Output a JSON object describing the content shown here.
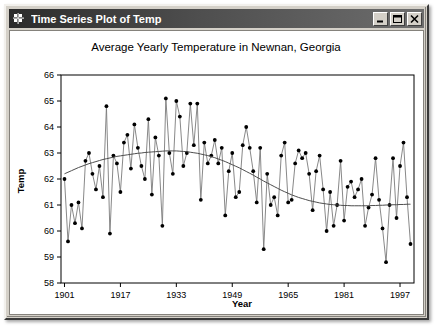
{
  "window": {
    "title": "Time Series Plot of Temp",
    "icon": "grid-chart-icon",
    "buttons": {
      "minimize": "minimize-icon",
      "maximize": "maximize-icon",
      "close": "close-icon"
    }
  },
  "colors": {
    "titlebar_dark": "#2b2b2b",
    "titlebar_light": "#6d6d6d",
    "window_face": "#d4d0c8",
    "plot_background": "#ffffff",
    "series_line": "#7a7a7a",
    "marker_fill": "#000000",
    "trend_line": "#4d4d4d",
    "axis": "#000000"
  },
  "chart_data": {
    "type": "line",
    "title": "Average Yearly Temperature in Newnan, Georgia",
    "xlabel": "Year",
    "ylabel": "Temp",
    "xlim": [
      1900,
      2001
    ],
    "ylim": [
      58,
      66
    ],
    "xticks": [
      1901,
      1917,
      1933,
      1949,
      1965,
      1981,
      1997
    ],
    "yticks": [
      58,
      59,
      60,
      61,
      62,
      63,
      64,
      65,
      66
    ],
    "grid": false,
    "legend": "none",
    "markers": true,
    "x": [
      1901,
      1902,
      1903,
      1904,
      1905,
      1906,
      1907,
      1908,
      1909,
      1910,
      1911,
      1912,
      1913,
      1914,
      1915,
      1916,
      1917,
      1918,
      1919,
      1920,
      1921,
      1922,
      1923,
      1924,
      1925,
      1926,
      1927,
      1928,
      1929,
      1930,
      1931,
      1932,
      1933,
      1934,
      1935,
      1936,
      1937,
      1938,
      1939,
      1940,
      1941,
      1942,
      1943,
      1944,
      1945,
      1946,
      1947,
      1948,
      1949,
      1950,
      1951,
      1952,
      1953,
      1954,
      1955,
      1956,
      1957,
      1958,
      1959,
      1960,
      1961,
      1962,
      1963,
      1964,
      1965,
      1966,
      1967,
      1968,
      1969,
      1970,
      1971,
      1972,
      1973,
      1974,
      1975,
      1976,
      1977,
      1978,
      1979,
      1980,
      1981,
      1982,
      1983,
      1984,
      1985,
      1986,
      1987,
      1988,
      1989,
      1990,
      1991,
      1992,
      1993,
      1994,
      1995,
      1996,
      1997,
      1998,
      1999,
      2000
    ],
    "series": [
      {
        "name": "Temp",
        "values": [
          62.0,
          59.6,
          61.0,
          60.3,
          61.1,
          60.1,
          62.7,
          63.0,
          62.2,
          61.6,
          62.5,
          61.3,
          64.8,
          59.9,
          62.9,
          62.6,
          61.5,
          63.4,
          63.7,
          62.4,
          64.1,
          63.2,
          62.5,
          62.0,
          64.3,
          61.4,
          63.6,
          62.9,
          60.2,
          65.1,
          63.0,
          62.2,
          65.0,
          64.4,
          62.5,
          63.0,
          64.9,
          63.3,
          64.9,
          61.2,
          63.4,
          62.6,
          62.9,
          63.5,
          62.6,
          63.2,
          60.6,
          62.3,
          63.0,
          61.3,
          61.5,
          63.3,
          64.0,
          63.2,
          62.3,
          61.1,
          63.2,
          59.3,
          62.2,
          61.0,
          61.3,
          60.6,
          62.9,
          63.4,
          61.1,
          61.2,
          62.6,
          63.1,
          62.8,
          63.0,
          62.2,
          60.8,
          62.3,
          62.9,
          61.6,
          60.0,
          61.5,
          60.2,
          61.0,
          62.7,
          60.4,
          61.7,
          61.9,
          61.3,
          61.6,
          62.0,
          60.2,
          60.9,
          61.4,
          62.8,
          61.2,
          60.1,
          58.8,
          61.0,
          62.8,
          60.5,
          62.5,
          63.4,
          61.3,
          59.5
        ]
      },
      {
        "name": "Smoothed trend",
        "type": "smooth",
        "values": [
          62.2,
          62.26,
          62.32,
          62.38,
          62.44,
          62.49,
          62.54,
          62.59,
          62.63,
          62.67,
          62.71,
          62.75,
          62.78,
          62.81,
          62.84,
          62.87,
          62.89,
          62.91,
          62.93,
          62.95,
          62.97,
          62.99,
          63.0,
          63.02,
          63.03,
          63.04,
          63.05,
          63.06,
          63.07,
          63.08,
          63.08,
          63.08,
          63.08,
          63.07,
          63.06,
          63.05,
          63.03,
          63.01,
          62.99,
          62.96,
          62.93,
          62.9,
          62.86,
          62.82,
          62.77,
          62.72,
          62.67,
          62.61,
          62.55,
          62.49,
          62.43,
          62.36,
          62.29,
          62.22,
          62.15,
          62.07,
          62.0,
          61.92,
          61.85,
          61.78,
          61.71,
          61.64,
          61.57,
          61.51,
          61.45,
          61.39,
          61.34,
          61.29,
          61.25,
          61.21,
          61.17,
          61.14,
          61.11,
          61.08,
          61.06,
          61.04,
          61.02,
          61.01,
          61.0,
          60.99,
          60.98,
          60.98,
          60.97,
          60.97,
          60.97,
          60.97,
          60.97,
          60.97,
          60.98,
          60.98,
          60.99,
          60.99,
          61.0,
          61.0,
          61.01,
          61.01,
          61.02,
          61.02,
          61.03,
          61.03
        ]
      }
    ]
  }
}
